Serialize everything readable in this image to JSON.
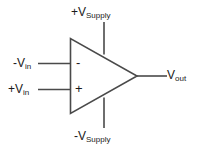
{
  "diagram": {
    "component": "op-amp",
    "colors": {
      "background": "#ffffff",
      "stroke": "#4a4a4a",
      "text": "#1a1a1a"
    },
    "terminals": {
      "inverting_input": {
        "label_sign": "-",
        "label_base": "V",
        "label_sub": "in",
        "symbol": "-"
      },
      "noninverting_input": {
        "label_sign": "+",
        "label_base": "V",
        "label_sub": "in",
        "symbol": "+"
      },
      "output": {
        "label_sign": "",
        "label_base": "V",
        "label_sub": "out"
      },
      "positive_supply": {
        "label_sign": "+",
        "label_base": "V",
        "label_sub": "Supply"
      },
      "negative_supply": {
        "label_sign": "-",
        "label_base": "V",
        "label_sub": "Supply"
      }
    }
  }
}
